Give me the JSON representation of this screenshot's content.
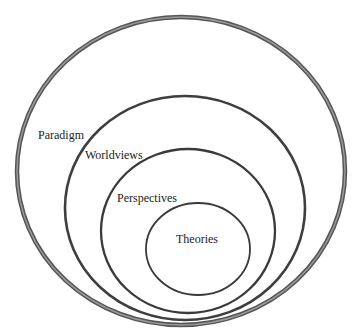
{
  "diagram": {
    "type": "nested-ellipses",
    "colors": {
      "outer_stroke": "#5a5a5a",
      "outer_fill_stroke": "#8a8a8a",
      "inner_stroke": "#3a3a3a",
      "text": "#222222",
      "background": "#ffffff"
    },
    "layers": [
      {
        "label": "Paradigm",
        "level": 1
      },
      {
        "label": "Worldviews",
        "level": 2
      },
      {
        "label": "Perspectives",
        "level": 3
      },
      {
        "label": "Theories",
        "level": 4
      }
    ]
  }
}
